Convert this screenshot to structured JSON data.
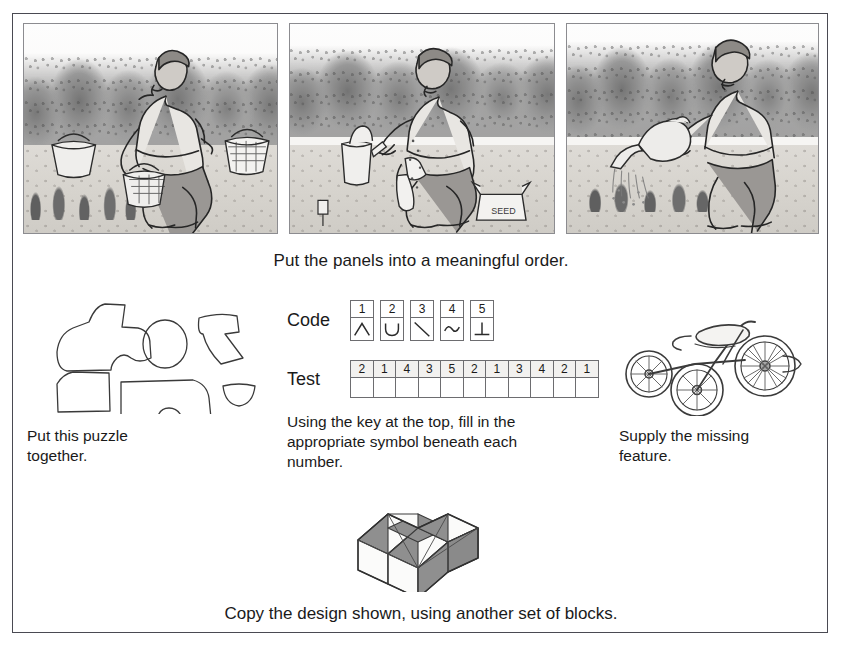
{
  "page": {
    "strip_caption": "Put the panels into a meaningful order.",
    "block_caption": "Copy the design shown, using another set of blocks.",
    "bleed_text": "partially visible text line cut off below the figure border"
  },
  "panels": [
    {
      "name": "panel-picking-berries",
      "alt": "Man kneeling in garden picking berries with baskets"
    },
    {
      "name": "panel-sowing-seeds",
      "alt": "Man kneeling, sowing seed from a box with a trowel, watering can nearby"
    },
    {
      "name": "panel-watering",
      "alt": "Man standing, watering young plants with a watering can"
    }
  ],
  "tasks": {
    "puzzle": {
      "caption": "Put this puzzle together.",
      "pieces": [
        "truck-cab-piece",
        "circle-wheel-piece",
        "truck-rear-piece",
        "corner-piece",
        "truck-body-piece",
        "half-disc-piece"
      ]
    },
    "coding": {
      "code_label": "Code",
      "test_label": "Test",
      "key": [
        {
          "number": "1",
          "symbol": "caret"
        },
        {
          "number": "2",
          "symbol": "cup"
        },
        {
          "number": "3",
          "symbol": "diagonal"
        },
        {
          "number": "4",
          "symbol": "tilde"
        },
        {
          "number": "5",
          "symbol": "perpendicular"
        }
      ],
      "test_numbers": [
        "2",
        "1",
        "4",
        "3",
        "5",
        "2",
        "1",
        "3",
        "4",
        "2",
        "1"
      ],
      "caption": "Using the key at the top, fill in the appropriate symbol beneath each number."
    },
    "missing_feature": {
      "caption": "Supply the missing feature.",
      "object": "tricycle"
    }
  },
  "colors": {
    "ink": "#1a1a1a",
    "border": "#4a4a52",
    "line": "#6d6d70",
    "block_light": "#fbfbfa",
    "block_dark": "#8f8f8f"
  }
}
